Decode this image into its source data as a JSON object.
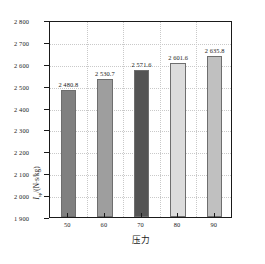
{
  "chart_data": {
    "type": "bar",
    "title": "",
    "xlabel": "压力",
    "ylabel": "I_sp/(N·s/kg)",
    "ylabel_parts": {
      "symbol": "I",
      "subscript": "sp",
      "units": "/(N·s/kg)"
    },
    "categories": [
      "50",
      "60",
      "70",
      "80",
      "90"
    ],
    "values": [
      2480.8,
      2530.7,
      2571.6,
      2601.6,
      2635.8
    ],
    "value_labels": [
      "2 480.8",
      "2 530.7",
      "2 571.6",
      "2 601.6",
      "2 635.8"
    ],
    "ylim": [
      1900,
      2800
    ],
    "yticks": [
      1900,
      2000,
      2100,
      2200,
      2300,
      2400,
      2500,
      2600,
      2700,
      2800
    ],
    "ytick_labels": [
      "1 900",
      "2 000",
      "2 100",
      "2 200",
      "2 300",
      "2 400",
      "2 500",
      "2 600",
      "2 700",
      "2 800"
    ],
    "grid": true,
    "legend": "none",
    "bar_colors": [
      "#808080",
      "#9e9e9e",
      "#545454",
      "#dcdcdc",
      "#c0c0c0"
    ],
    "bar_border_color": "#6e6e6e",
    "axis_color": "#1a1a1a",
    "grid_color": "#c9c9c9",
    "background": "#ffffff"
  }
}
